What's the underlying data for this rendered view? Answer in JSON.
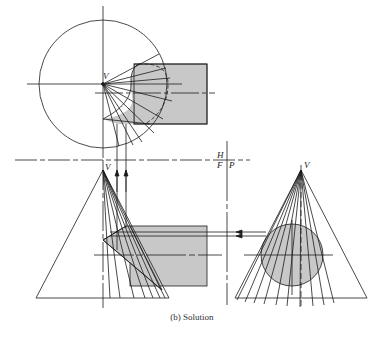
{
  "figure": {
    "caption": "(b) Solution",
    "colors": {
      "line": "#1c1c1c",
      "fill": "#c8c8c8",
      "background": "#ffffff"
    },
    "labels": {
      "vertex_top": "V",
      "vertex_front": "V",
      "vertex_profile": "V",
      "fold_h": "H",
      "fold_f": "F",
      "fold_p": "P"
    },
    "views": [
      {
        "name": "top-view",
        "description": "Cone base circle with cylinder rectangle and element lines from V"
      },
      {
        "name": "front-view",
        "description": "Cone triangle intersected by cylinder with element lines"
      },
      {
        "name": "profile-view",
        "description": "Cone triangle with circular cylinder end view"
      }
    ]
  }
}
